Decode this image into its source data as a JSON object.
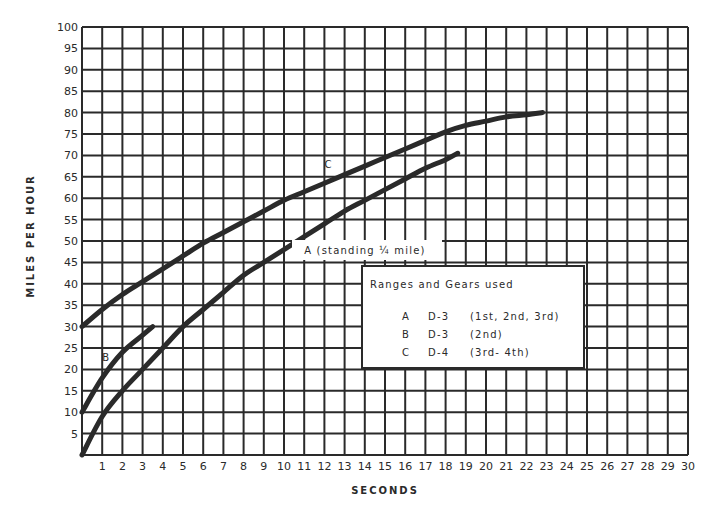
{
  "chart_data": {
    "type": "line",
    "title": "",
    "xlabel": "SECONDS",
    "ylabel": "MILES PER HOUR",
    "xlim": [
      0,
      30
    ],
    "ylim": [
      0,
      100
    ],
    "grid": true,
    "x_ticks": [
      1,
      2,
      3,
      4,
      5,
      6,
      7,
      8,
      9,
      10,
      11,
      12,
      13,
      14,
      15,
      16,
      17,
      18,
      19,
      20,
      21,
      22,
      23,
      24,
      25,
      26,
      27,
      28,
      29,
      30
    ],
    "y_ticks": [
      5,
      10,
      15,
      20,
      25,
      30,
      35,
      40,
      45,
      50,
      55,
      60,
      65,
      70,
      75,
      80,
      85,
      90,
      95,
      100
    ],
    "series": [
      {
        "name": "A",
        "label": "A   (standing ¼ mile)",
        "x": [
          0,
          1,
          2,
          3,
          4,
          5,
          6,
          7,
          8,
          9,
          10,
          11,
          12,
          13,
          14,
          15,
          16,
          17,
          18,
          18.6
        ],
        "y": [
          0,
          9,
          15,
          20,
          25,
          30,
          34,
          38,
          42,
          45,
          48,
          51,
          54,
          57,
          59.5,
          62,
          64.5,
          67,
          69,
          70.5
        ]
      },
      {
        "name": "B",
        "label": "B",
        "x": [
          0,
          1,
          2,
          3,
          3.5
        ],
        "y": [
          10,
          18,
          24,
          28,
          30
        ]
      },
      {
        "name": "C",
        "label": "C",
        "x": [
          0,
          1,
          2,
          3,
          4,
          5,
          6,
          7,
          8,
          9,
          10,
          11,
          12,
          13,
          14,
          15,
          16,
          17,
          18,
          19,
          20,
          21,
          22,
          22.8
        ],
        "y": [
          30,
          34,
          37.5,
          40.5,
          43.5,
          46.5,
          49.5,
          52,
          54.5,
          57,
          59.5,
          61.5,
          63.5,
          65.5,
          67.5,
          69.5,
          71.5,
          73.5,
          75.5,
          77,
          78,
          79,
          79.5,
          80
        ]
      }
    ],
    "legend": {
      "title": "Ranges and Gears used",
      "position": "inside-right",
      "entries": [
        {
          "key": "A",
          "range": "D-3",
          "gears": "(1st,  2nd,  3rd)"
        },
        {
          "key": "B",
          "range": "D-3",
          "gears": "(2nd)"
        },
        {
          "key": "C",
          "range": "D-4",
          "gears": "(3rd-  4th)"
        }
      ]
    },
    "annotations": [
      {
        "text": "A   (standing ¼ mile)",
        "x": 11,
        "y": 47
      },
      {
        "text": "B",
        "x": 1,
        "y": 22
      },
      {
        "text": "C",
        "x": 12,
        "y": 67
      }
    ]
  },
  "style": {
    "ink": "#2a2a2a",
    "background": "#ffffff"
  }
}
